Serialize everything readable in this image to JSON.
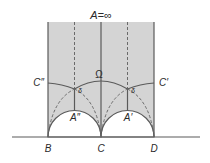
{
  "diagram": {
    "title_label": "A=∞",
    "omega_label": "Ω",
    "labels": {
      "c_double_prime": "C″",
      "c_prime": "C′",
      "a_double_prime": "A″",
      "a_prime": "A′",
      "delta_left": "δ",
      "delta_right": "δ",
      "b": "B",
      "c": "C",
      "d": "D"
    },
    "colors": {
      "shade": "#d4d4d4",
      "line": "#5a5a5a",
      "dashed": "#6a6a6a",
      "background": "#ffffff",
      "text": "#2a2a2a"
    }
  }
}
